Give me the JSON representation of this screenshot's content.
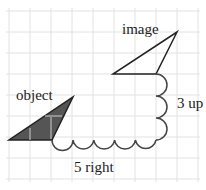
{
  "labels": {
    "object": "object",
    "image": "image",
    "horizontal": "5 right",
    "vertical": "3 up"
  },
  "translation": {
    "right": 5,
    "up": 3
  },
  "colors": {
    "grid": "#e4e4e4",
    "object_fill": "#555555",
    "stroke": "#222222",
    "background": "#ffffff"
  }
}
